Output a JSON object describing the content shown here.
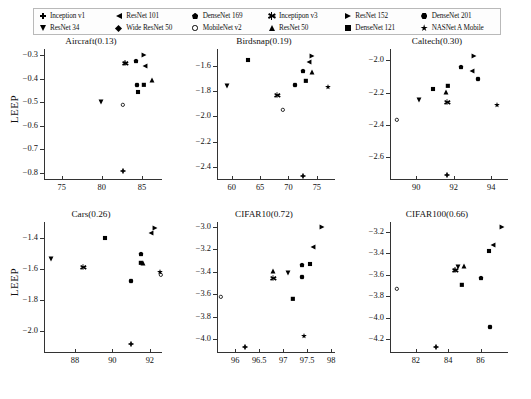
{
  "figure": {
    "ylabel": "LEEP",
    "legend": [
      {
        "label": "Inception v1",
        "marker": "plus"
      },
      {
        "label": "ResNet 34",
        "marker": "triangle-down"
      },
      {
        "label": "ResNet 101",
        "marker": "triangle-left"
      },
      {
        "label": "Wide ResNet 50",
        "marker": "diamond"
      },
      {
        "label": "DenseNet 169",
        "marker": "pentagon"
      },
      {
        "label": "MobileNet v2",
        "marker": "circle-open"
      },
      {
        "label": "Inceptipon v3",
        "marker": "star6"
      },
      {
        "label": "ResNet 50",
        "marker": "triangle-up"
      },
      {
        "label": "ResNet 152",
        "marker": "triangle-right"
      },
      {
        "label": "DenseNet 121",
        "marker": "square"
      },
      {
        "label": "DenseNet 201",
        "marker": "hexagon"
      },
      {
        "label": "NASNet A Mobile",
        "marker": "star5"
      }
    ]
  },
  "chart_data": [
    {
      "type": "scatter",
      "title": "Aircraft(0.13)",
      "xlabel": "",
      "ylabel": "LEEP",
      "xlim": [
        72.8,
        87.5
      ],
      "ylim": [
        -0.83,
        -0.275
      ],
      "xticks": [
        75,
        80,
        85
      ],
      "yticks": [
        -0.3,
        -0.4,
        -0.5,
        -0.6,
        -0.7,
        -0.8
      ],
      "grid": false,
      "points": [
        {
          "name": "Inception v1",
          "marker": "plus",
          "x": 82.6,
          "y": -0.793
        },
        {
          "name": "Inceptipon v3",
          "marker": "star6",
          "x": 82.9,
          "y": -0.333
        },
        {
          "name": "ResNet 34",
          "marker": "triangle-down",
          "x": 79.9,
          "y": -0.5
        },
        {
          "name": "ResNet 50",
          "marker": "triangle-up",
          "x": 86.2,
          "y": -0.408
        },
        {
          "name": "ResNet 101",
          "marker": "triangle-left",
          "x": 85.4,
          "y": -0.345
        },
        {
          "name": "ResNet 152",
          "marker": "triangle-right",
          "x": 85.2,
          "y": -0.3
        },
        {
          "name": "Wide ResNet 50",
          "marker": "diamond",
          "x": 84.5,
          "y": -0.457
        },
        {
          "name": "DenseNet 121",
          "marker": "square",
          "x": 85.2,
          "y": -0.428
        },
        {
          "name": "DenseNet 169",
          "marker": "pentagon",
          "x": 84.3,
          "y": -0.327
        },
        {
          "name": "DenseNet 201",
          "marker": "hexagon",
          "x": 84.4,
          "y": -0.428
        },
        {
          "name": "MobileNet v2",
          "marker": "circle-open",
          "x": 82.6,
          "y": -0.513
        },
        {
          "name": "NASNet A Mobile",
          "marker": "star5",
          "x": 82.9,
          "y": -0.333
        }
      ]
    },
    {
      "type": "scatter",
      "title": "Birdsnap(0.19)",
      "xlabel": "",
      "ylabel": "",
      "xlim": [
        57.4,
        78.2
      ],
      "ylim": [
        -2.5,
        -1.47
      ],
      "xticks": [
        60,
        65,
        70,
        75
      ],
      "yticks": [
        -1.6,
        -1.8,
        -2.0,
        -2.2,
        -2.4
      ],
      "grid": false,
      "points": [
        {
          "name": "Inception v1",
          "marker": "plus",
          "x": 72.6,
          "y": -2.465
        },
        {
          "name": "Inceptipon v3",
          "marker": "star6",
          "x": 68.0,
          "y": -1.828
        },
        {
          "name": "ResNet 34",
          "marker": "triangle-down",
          "x": 59.2,
          "y": -1.76
        },
        {
          "name": "ResNet 50",
          "marker": "triangle-up",
          "x": 74.2,
          "y": -1.65
        },
        {
          "name": "ResNet 101",
          "marker": "triangle-left",
          "x": 73.7,
          "y": -1.57
        },
        {
          "name": "ResNet 152",
          "marker": "triangle-right",
          "x": 74.1,
          "y": -1.525
        },
        {
          "name": "Wide ResNet 50",
          "marker": "diamond",
          "x": 62.8,
          "y": -1.56
        },
        {
          "name": "DenseNet 121",
          "marker": "square",
          "x": 73.0,
          "y": -1.72
        },
        {
          "name": "DenseNet 169",
          "marker": "pentagon",
          "x": 72.5,
          "y": -1.643
        },
        {
          "name": "DenseNet 201",
          "marker": "hexagon",
          "x": 71.1,
          "y": -1.75
        },
        {
          "name": "MobileNet v2",
          "marker": "circle-open",
          "x": 69.1,
          "y": -1.952
        },
        {
          "name": "NASNet A Mobile",
          "marker": "star5",
          "x": 76.9,
          "y": -1.768
        }
      ]
    },
    {
      "type": "scatter",
      "title": "Caltech(0.30)",
      "xlabel": "",
      "ylabel": "",
      "xlim": [
        88.6,
        94.9
      ],
      "ylim": [
        -2.74,
        -1.93
      ],
      "xticks": [
        90,
        92,
        94
      ],
      "yticks": [
        -2.0,
        -2.2,
        -2.4,
        -2.6
      ],
      "grid": false,
      "points": [
        {
          "name": "Inception v1",
          "marker": "plus",
          "x": 91.65,
          "y": -2.71
        },
        {
          "name": "Inceptipon v3",
          "marker": "star6",
          "x": 91.62,
          "y": -2.258
        },
        {
          "name": "ResNet 34",
          "marker": "triangle-down",
          "x": 90.15,
          "y": -2.243
        },
        {
          "name": "ResNet 50",
          "marker": "triangle-up",
          "x": 91.6,
          "y": -2.196
        },
        {
          "name": "ResNet 101",
          "marker": "triangle-left",
          "x": 93.0,
          "y": -2.066
        },
        {
          "name": "ResNet 152",
          "marker": "triangle-right",
          "x": 93.1,
          "y": -1.975
        },
        {
          "name": "Wide ResNet 50",
          "marker": "diamond",
          "x": 90.9,
          "y": -2.18
        },
        {
          "name": "DenseNet 121",
          "marker": "square",
          "x": 91.72,
          "y": -2.158
        },
        {
          "name": "DenseNet 169",
          "marker": "pentagon",
          "x": 92.4,
          "y": -2.04
        },
        {
          "name": "DenseNet 201",
          "marker": "hexagon",
          "x": 93.3,
          "y": -2.118
        },
        {
          "name": "MobileNet v2",
          "marker": "circle-open",
          "x": 88.95,
          "y": -2.372
        },
        {
          "name": "NASNet A Mobile",
          "marker": "star5",
          "x": 94.3,
          "y": -2.278
        }
      ]
    },
    {
      "type": "scatter",
      "title": "Cars(0.26)",
      "xlabel": "",
      "ylabel": "LEEP",
      "xlim": [
        86.35,
        92.65
      ],
      "ylim": [
        -2.14,
        -1.3
      ],
      "xticks": [
        88,
        90,
        92
      ],
      "yticks": [
        -1.4,
        -1.6,
        -1.8,
        -2.0
      ],
      "grid": false,
      "points": [
        {
          "name": "Inception v1",
          "marker": "plus",
          "x": 91.02,
          "y": -2.085
        },
        {
          "name": "Inceptipon v3",
          "marker": "star6",
          "x": 88.45,
          "y": -1.59
        },
        {
          "name": "ResNet 34",
          "marker": "triangle-down",
          "x": 86.7,
          "y": -1.535
        },
        {
          "name": "ResNet 50",
          "marker": "triangle-up",
          "x": 91.62,
          "y": -1.565
        },
        {
          "name": "ResNet 101",
          "marker": "triangle-left",
          "x": 92.08,
          "y": -1.372
        },
        {
          "name": "ResNet 152",
          "marker": "triangle-right",
          "x": 92.3,
          "y": -1.34
        },
        {
          "name": "Wide ResNet 50",
          "marker": "diamond",
          "x": 89.62,
          "y": -1.4
        },
        {
          "name": "DenseNet 121",
          "marker": "square",
          "x": 91.52,
          "y": -1.56
        },
        {
          "name": "DenseNet 169",
          "marker": "pentagon",
          "x": 91.55,
          "y": -1.505
        },
        {
          "name": "DenseNet 201",
          "marker": "hexagon",
          "x": 91.0,
          "y": -1.678
        },
        {
          "name": "MobileNet v2",
          "marker": "circle-open",
          "x": 92.6,
          "y": -1.64
        },
        {
          "name": "NASNet A Mobile",
          "marker": "star5",
          "x": 92.55,
          "y": -1.62
        }
      ]
    },
    {
      "type": "scatter",
      "title": "CIFAR10(0.72)",
      "xlabel": "",
      "ylabel": "",
      "xlim": [
        95.62,
        98.08
      ],
      "ylim": [
        -4.12,
        -2.96
      ],
      "xticks": [
        96.0,
        96.5,
        97.0,
        97.5,
        98.0
      ],
      "yticks": [
        -3.0,
        -3.2,
        -3.4,
        -3.6,
        -3.8,
        -4.0
      ],
      "grid": false,
      "points": [
        {
          "name": "Inception v1",
          "marker": "plus",
          "x": 96.2,
          "y": -4.065
        },
        {
          "name": "Inceptipon v3",
          "marker": "star6",
          "x": 96.79,
          "y": -3.455
        },
        {
          "name": "ResNet 34",
          "marker": "triangle-down",
          "x": 97.09,
          "y": -3.408
        },
        {
          "name": "ResNet 50",
          "marker": "triangle-up",
          "x": 96.79,
          "y": -3.395
        },
        {
          "name": "ResNet 101",
          "marker": "triangle-left",
          "x": 97.63,
          "y": -3.182
        },
        {
          "name": "ResNet 152",
          "marker": "triangle-right",
          "x": 97.8,
          "y": -3.0
        },
        {
          "name": "Wide ResNet 50",
          "marker": "diamond",
          "x": 97.56,
          "y": -3.33
        },
        {
          "name": "DenseNet 121",
          "marker": "square",
          "x": 97.2,
          "y": -3.645
        },
        {
          "name": "DenseNet 169",
          "marker": "pentagon",
          "x": 97.39,
          "y": -3.34
        },
        {
          "name": "DenseNet 201",
          "marker": "hexagon",
          "x": 97.4,
          "y": -3.45
        },
        {
          "name": "MobileNet v2",
          "marker": "circle-open",
          "x": 95.7,
          "y": -3.625
        },
        {
          "name": "NASNet A Mobile",
          "marker": "star5",
          "x": 97.43,
          "y": -3.97
        }
      ]
    },
    {
      "type": "scatter",
      "title": "CIFAR100(0.66)",
      "xlabel": "",
      "ylabel": "",
      "xlim": [
        80.4,
        87.7
      ],
      "ylim": [
        -4.33,
        -3.11
      ],
      "xticks": [
        82,
        84,
        86
      ],
      "yticks": [
        -3.2,
        -3.4,
        -3.6,
        -3.8,
        -4.0,
        -4.2
      ],
      "grid": false,
      "points": [
        {
          "name": "Inception v1",
          "marker": "plus",
          "x": 83.25,
          "y": -4.27
        },
        {
          "name": "Inceptipon v3",
          "marker": "star6",
          "x": 84.45,
          "y": -3.555
        },
        {
          "name": "ResNet 34",
          "marker": "triangle-down",
          "x": 84.6,
          "y": -3.525
        },
        {
          "name": "ResNet 50",
          "marker": "triangle-up",
          "x": 85.0,
          "y": -3.52
        },
        {
          "name": "ResNet 101",
          "marker": "triangle-left",
          "x": 86.8,
          "y": -3.32
        },
        {
          "name": "ResNet 152",
          "marker": "triangle-right",
          "x": 87.35,
          "y": -3.155
        },
        {
          "name": "Wide ResNet 50",
          "marker": "diamond",
          "x": 86.5,
          "y": -3.38
        },
        {
          "name": "DenseNet 121",
          "marker": "square",
          "x": 84.85,
          "y": -3.7
        },
        {
          "name": "DenseNet 169",
          "marker": "pentagon",
          "x": 86.05,
          "y": -3.635
        },
        {
          "name": "DenseNet 201",
          "marker": "hexagon",
          "x": 86.6,
          "y": -4.09
        },
        {
          "name": "MobileNet v2",
          "marker": "circle-open",
          "x": 80.85,
          "y": -3.735
        },
        {
          "name": "NASNet A Mobile",
          "marker": "star5",
          "x": 84.45,
          "y": -3.555
        }
      ]
    }
  ]
}
